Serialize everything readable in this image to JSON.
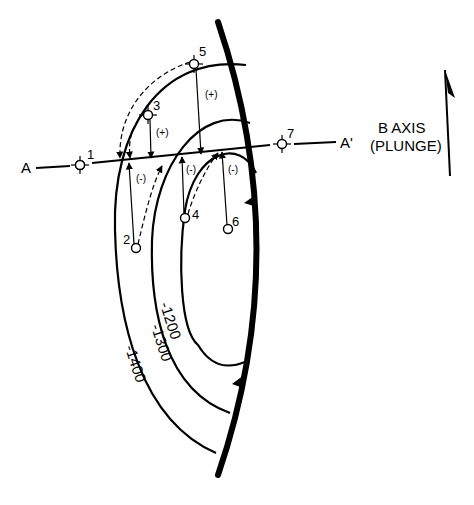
{
  "diagram": {
    "type": "structure-contour map with fault and cross-section line",
    "section_line": {
      "start_label": "A",
      "end_label": "A'"
    },
    "b_axis": {
      "line1": "B AXIS",
      "line2": "(PLUNGE)"
    },
    "contours": [
      {
        "label": "-1200"
      },
      {
        "label": "-1300"
      },
      {
        "label": "-1400"
      }
    ],
    "wells": [
      {
        "id": "1"
      },
      {
        "id": "2"
      },
      {
        "id": "3"
      },
      {
        "id": "4"
      },
      {
        "id": "5"
      },
      {
        "id": "6"
      },
      {
        "id": "7"
      }
    ],
    "projection_signs": {
      "plus_upper": "(+)",
      "plus_left": "(+)",
      "minus_left": "(-)",
      "minus_mid": "(-)",
      "minus_right": "(-)"
    },
    "colors": {
      "ink": "#000000",
      "background": "#ffffff"
    }
  }
}
